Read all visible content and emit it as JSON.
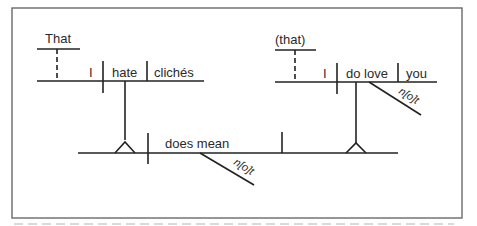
{
  "diagram": {
    "type": "sentence-diagram",
    "left_clause": {
      "conjunction": "That",
      "subject": "I",
      "verb": "hate",
      "object": "clichés"
    },
    "right_clause": {
      "conjunction": "(that)",
      "subject": "I",
      "verb": "do love",
      "object": "you",
      "modifier": "n[o]t"
    },
    "main_clause": {
      "verb": "does mean",
      "modifier": "n[o]t"
    }
  }
}
